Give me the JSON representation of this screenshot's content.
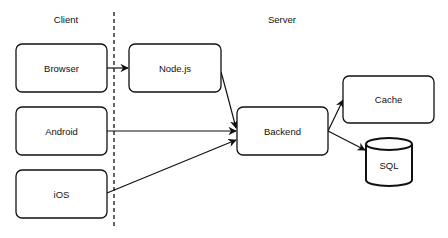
{
  "diagram": {
    "colors": {
      "stroke": "#111111",
      "fill": "#ffffff",
      "text": "#111111"
    },
    "sections": {
      "client": "Client",
      "server": "Server"
    },
    "nodes": {
      "browser": "Browser",
      "nodejs": "Node.js",
      "android": "Android",
      "ios": "iOS",
      "backend": "Backend",
      "cache": "Cache",
      "sql": "SQL"
    },
    "edges": [
      {
        "from": "Browser",
        "to": "Node.js"
      },
      {
        "from": "Node.js",
        "to": "Backend"
      },
      {
        "from": "Android",
        "to": "Backend"
      },
      {
        "from": "iOS",
        "to": "Backend"
      },
      {
        "from": "Backend",
        "to": "Cache"
      },
      {
        "from": "Backend",
        "to": "SQL"
      }
    ]
  }
}
